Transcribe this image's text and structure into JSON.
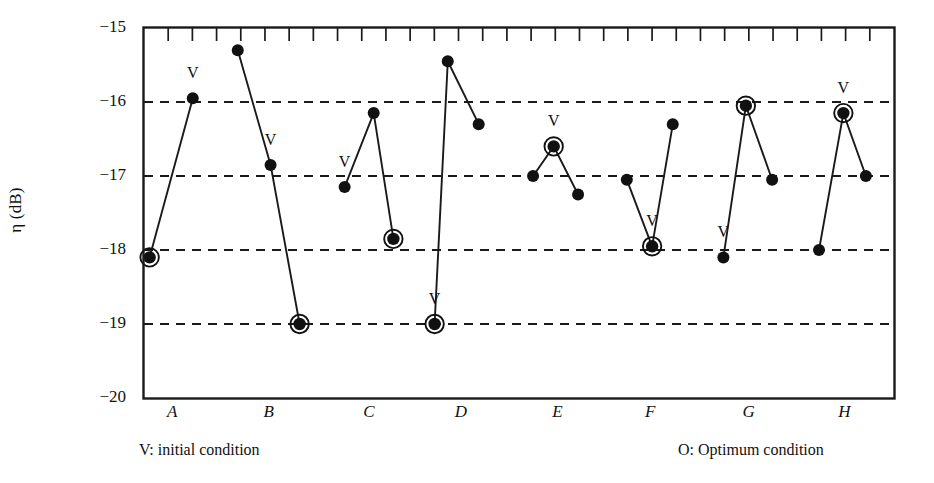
{
  "chart_data": {
    "type": "line",
    "title": "",
    "xlabel": "",
    "ylabel": "η (dB)",
    "ylim": [
      -20,
      -15
    ],
    "yticks": [
      "-15",
      "-16",
      "-17",
      "-18",
      "-19",
      "-20"
    ],
    "ytick_values": [
      -15,
      -16,
      -17,
      -18,
      -19,
      -20
    ],
    "grid": "horizontal dashed gridlines at -16, -17, -18, -19",
    "gridlines": [
      -16,
      -17,
      -18,
      -19
    ],
    "top_axis_minor_ticks": 30,
    "categories": [
      "A",
      "B",
      "C",
      "D",
      "E",
      "F",
      "G",
      "H"
    ],
    "legend_position": "below axes",
    "legend": [
      {
        "marker": "V",
        "label": "V:  initial condition"
      },
      {
        "marker": "O",
        "label": "O:  Optimum condition"
      }
    ],
    "marker_notes": {
      "filled_circle": "data point",
      "circled": "Optimum condition (O)",
      "v_annotation": "initial condition (V)"
    },
    "series": [
      {
        "name": "A",
        "points": [
          {
            "x": 0.06,
            "y": -18.1,
            "circled": true,
            "v": false
          },
          {
            "x": 0.52,
            "y": -15.95,
            "circled": false,
            "v": true
          }
        ]
      },
      {
        "name": "B",
        "points": [
          {
            "x": 1.0,
            "y": -15.3,
            "circled": false,
            "v": false
          },
          {
            "x": 1.35,
            "y": -16.85,
            "circled": false,
            "v": true
          },
          {
            "x": 1.66,
            "y": -19.0,
            "circled": true,
            "v": false
          }
        ]
      },
      {
        "name": "C",
        "points": [
          {
            "x": 2.14,
            "y": -17.15,
            "circled": false,
            "v": true
          },
          {
            "x": 2.45,
            "y": -16.15,
            "circled": false,
            "v": false
          },
          {
            "x": 2.66,
            "y": -17.85,
            "circled": true,
            "v": false
          }
        ]
      },
      {
        "name": "D",
        "points": [
          {
            "x": 3.1,
            "y": -19.0,
            "circled": true,
            "v": true
          },
          {
            "x": 3.24,
            "y": -15.45,
            "circled": false,
            "v": false
          },
          {
            "x": 3.57,
            "y": -16.3,
            "circled": false,
            "v": false
          }
        ]
      },
      {
        "name": "E",
        "points": [
          {
            "x": 4.15,
            "y": -17.0,
            "circled": false,
            "v": false
          },
          {
            "x": 4.37,
            "y": -16.6,
            "circled": true,
            "v": true
          },
          {
            "x": 4.63,
            "y": -17.25,
            "circled": false,
            "v": false
          }
        ]
      },
      {
        "name": "F",
        "points": [
          {
            "x": 5.15,
            "y": -17.05,
            "circled": false,
            "v": false
          },
          {
            "x": 5.42,
            "y": -17.95,
            "circled": true,
            "v": true
          },
          {
            "x": 5.64,
            "y": -16.3,
            "circled": false,
            "v": false
          }
        ]
      },
      {
        "name": "G",
        "points": [
          {
            "x": 6.18,
            "y": -18.1,
            "circled": false,
            "v": true
          },
          {
            "x": 6.42,
            "y": -16.05,
            "circled": true,
            "v": false
          },
          {
            "x": 6.7,
            "y": -17.05,
            "circled": false,
            "v": false
          }
        ]
      },
      {
        "name": "H",
        "points": [
          {
            "x": 7.2,
            "y": -18.0,
            "circled": false,
            "v": false
          },
          {
            "x": 7.46,
            "y": -16.15,
            "circled": true,
            "v": true
          },
          {
            "x": 7.7,
            "y": -17.0,
            "circled": false,
            "v": false
          }
        ]
      }
    ]
  },
  "axes": {
    "ylabel": "η (dB)"
  },
  "legend": {
    "initial": "V:  initial condition",
    "optimum": "O:  Optimum condition"
  }
}
